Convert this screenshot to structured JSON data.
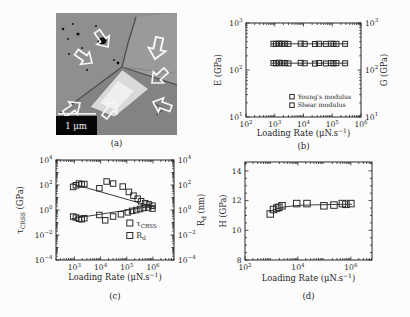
{
  "figure": {
    "background": "#fcfcfc",
    "text_color": "#1d1d1d",
    "panels": [
      {
        "id": "a",
        "label": "(a)",
        "type": "sem-image",
        "scale_bar_label": "1 μm"
      },
      {
        "id": "b",
        "label": "(b)",
        "type": "chart"
      },
      {
        "id": "c",
        "label": "(c)",
        "type": "chart"
      },
      {
        "id": "d",
        "label": "(d)",
        "type": "chart"
      }
    ]
  },
  "chart_data": [
    {
      "panel": "b",
      "type": "scatter",
      "x_scale": "log",
      "y_scale": "log",
      "xlabel": [
        {
          "t": "Loading Rate (μN.s"
        },
        {
          "t": "−1",
          "s": "sup"
        },
        {
          "t": ")"
        }
      ],
      "ylabel_left": [
        {
          "t": "E (GPa)"
        }
      ],
      "ylabel_right": [
        {
          "t": "G (GPa)"
        }
      ],
      "xlim_exp": [
        2,
        6
      ],
      "ylim_exp": [
        1,
        3
      ],
      "x_ticks_exp": [
        2,
        3,
        4,
        5,
        6
      ],
      "y_ticks_exp": [
        1,
        2,
        3
      ],
      "right_tick_labels": true,
      "grid": false,
      "series": [
        {
          "name": [
            {
              "t": "Young's modulus"
            }
          ],
          "x": [
            900,
            1100,
            1400,
            1800,
            2300,
            3000,
            8000,
            11000,
            25000,
            35000,
            60000,
            90000,
            110000,
            140000,
            280000
          ],
          "y": [
            362,
            358,
            366,
            360,
            363,
            359,
            364,
            360,
            357,
            362,
            359,
            363,
            358,
            361,
            360
          ],
          "fit": {
            "x": [
              750,
              330000
            ],
            "y": [
              361,
              361
            ]
          }
        },
        {
          "name": [
            {
              "t": "Shear modulus"
            }
          ],
          "x": [
            900,
            1100,
            1400,
            1800,
            2300,
            3000,
            8000,
            11000,
            25000,
            35000,
            60000,
            90000,
            110000,
            140000,
            280000
          ],
          "y": [
            141,
            138,
            143,
            139,
            141,
            138,
            142,
            139,
            137,
            141,
            138,
            141,
            138,
            140,
            139
          ],
          "fit": {
            "x": [
              750,
              330000
            ],
            "y": [
              139.5,
              139.5
            ]
          }
        }
      ],
      "legend": {
        "fx": 0.38,
        "fy": 0.76
      }
    },
    {
      "panel": "c",
      "type": "scatter",
      "x_scale": "log",
      "y_scale": "log",
      "xlabel": [
        {
          "t": "Loading Rate (μN.s"
        },
        {
          "t": "−1",
          "s": "sup"
        },
        {
          "t": ")"
        }
      ],
      "ylabel_left": [
        {
          "t": "τ"
        },
        {
          "t": "CRSS",
          "s": "sub"
        },
        {
          "t": " (GPa)"
        }
      ],
      "ylabel_right": [
        {
          "t": "R"
        },
        {
          "t": "d",
          "s": "sub"
        },
        {
          "t": " (nm)"
        }
      ],
      "xlim_exp": [
        2.3,
        6.8
      ],
      "ylim_exp": [
        -4,
        4
      ],
      "x_ticks_exp": [
        3,
        4,
        5,
        6
      ],
      "y_ticks_exp": [
        -4,
        -2,
        0,
        2,
        4
      ],
      "right_tick_labels": true,
      "grid": false,
      "series": [
        {
          "name": [
            {
              "t": "τ"
            },
            {
              "t": "CRSS",
              "s": "sub"
            }
          ],
          "x": [
            900,
            1150,
            1500,
            1900,
            2400,
            9000,
            15000,
            30000,
            60000,
            110000,
            160000,
            230000,
            320000,
            450000,
            650000,
            950000
          ],
          "y": [
            0.3,
            0.25,
            0.2,
            0.18,
            0.22,
            0.4,
            0.15,
            0.3,
            0.45,
            0.65,
            0.85,
            1.0,
            1.2,
            1.45,
            1.6,
            1.3
          ],
          "fit": {
            "x": [
              800,
              1200000
            ],
            "y": [
              0.2,
              2.2
            ]
          }
        },
        {
          "name": [
            {
              "t": "R"
            },
            {
              "t": "d",
              "s": "sub"
            }
          ],
          "x": [
            900,
            1150,
            1500,
            1900,
            2400,
            9000,
            17000,
            30000,
            70000,
            120000,
            180000,
            260000,
            350000,
            500000,
            700000,
            950000
          ],
          "y": [
            70,
            95,
            130,
            110,
            120,
            55,
            190,
            130,
            75,
            28,
            14,
            8,
            5,
            3.5,
            2.8,
            2.2
          ],
          "fit": {
            "x": [
              800,
              1200000
            ],
            "y": [
              130,
              1.6
            ]
          }
        }
      ],
      "legend": {
        "fx": 0.6,
        "fy": 0.6
      }
    },
    {
      "panel": "d",
      "type": "scatter",
      "x_scale": "log",
      "y_scale": "linear",
      "xlabel": [
        {
          "t": "Loading Rate (μN.s"
        },
        {
          "t": "−1",
          "s": "sup"
        },
        {
          "t": ")"
        }
      ],
      "ylabel_left": [
        {
          "t": "H (GPa)"
        }
      ],
      "xlim_exp": [
        2,
        6.8
      ],
      "ylim": [
        8,
        14.6
      ],
      "x_ticks_exp": [
        2,
        4,
        6
      ],
      "y_ticks": [
        8,
        10,
        12,
        14
      ],
      "y_minor_step": 0.5,
      "grid": false,
      "series": [
        {
          "name": [
            {
              "t": "Hardness"
            }
          ],
          "x": [
            900,
            1200,
            1600,
            1900,
            2500,
            9000,
            22000,
            96000,
            230000,
            480000,
            650000,
            1000000
          ],
          "y": [
            11.1,
            11.4,
            11.5,
            11.55,
            11.65,
            11.8,
            11.8,
            11.65,
            11.7,
            11.8,
            11.75,
            11.8
          ],
          "fit": {
            "x": [
              800,
              1500,
              3000,
              6000,
              15000,
              50000,
              200000,
              1100000
            ],
            "y": [
              11.25,
              11.45,
              11.57,
              11.64,
              11.69,
              11.72,
              11.74,
              11.76
            ]
          }
        }
      ]
    }
  ]
}
